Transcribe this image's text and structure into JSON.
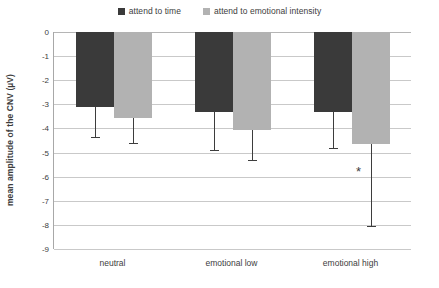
{
  "chart_data": {
    "type": "bar",
    "title": "",
    "xlabel": "",
    "ylabel": "mean amplitude of the CNV (µV)",
    "categories": [
      "neutral",
      "emotional low",
      "emotional high"
    ],
    "ylim": [
      -9,
      0
    ],
    "yticks": [
      0,
      -1,
      -2,
      -3,
      -4,
      -5,
      -6,
      -7,
      -8,
      -9
    ],
    "ytick_labels": [
      "0",
      "-1",
      "-2",
      "-3",
      "-4",
      "-5",
      "-6",
      "-7",
      "-8",
      "-9"
    ],
    "grid": true,
    "legend_position": "top-center",
    "series": [
      {
        "name": "attend to time",
        "color": "#3a3a3a",
        "values": [
          -3.1,
          -3.3,
          -3.3
        ],
        "error_low": [
          -4.35,
          -4.9,
          -4.8
        ]
      },
      {
        "name": "attend to emotional intensity",
        "color": "#b2b2b2",
        "values": [
          -3.55,
          -4.05,
          -4.65
        ],
        "error_low": [
          -4.6,
          -5.3,
          -8.05
        ]
      }
    ],
    "annotations": [
      {
        "text": "*",
        "category": "emotional high",
        "series": "attend to emotional intensity",
        "value": -5.75
      }
    ]
  },
  "colors": {
    "series_dark": "#3a3a3a",
    "series_light": "#b2b2b2",
    "gridline": "#c9c9c9",
    "axis": "#a8a8a8",
    "text": "#3d3d3d",
    "background": "#ffffff"
  }
}
